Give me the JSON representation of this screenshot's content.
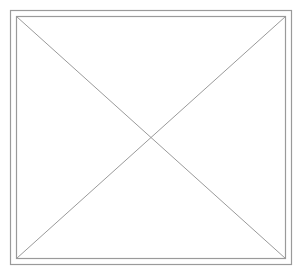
{
  "figure": {
    "background": "#ffffff",
    "stroke_color": "#9a9a9a",
    "outer_frame": {
      "x": 10.5,
      "y": 10.5,
      "width": 281,
      "height": 254
    },
    "inner_frame": {
      "x": 16.5,
      "y": 16.5,
      "width": 269,
      "height": 242
    },
    "diagonals": [
      {
        "x1": 16.5,
        "y1": 16.5,
        "x2": 285.5,
        "y2": 258.5
      },
      {
        "x1": 285.5,
        "y1": 16.5,
        "x2": 16.5,
        "y2": 258.5
      }
    ]
  }
}
